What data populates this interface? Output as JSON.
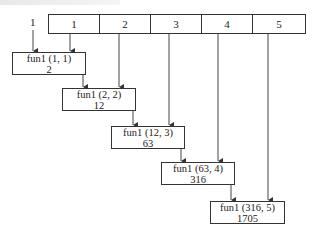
{
  "diagram": {
    "initial_value_label": "1",
    "header_cells": [
      "1",
      "2",
      "3",
      "4",
      "5"
    ],
    "calls": [
      {
        "call": "fun1 (1, 1)",
        "result": "2"
      },
      {
        "call": "fun1 (2, 2)",
        "result": "12"
      },
      {
        "call": "fun1 (12, 3)",
        "result": "63"
      },
      {
        "call": "fun1 (63, 4)",
        "result": "316"
      },
      {
        "call": "fun1 (316, 5)",
        "result": "1705"
      }
    ],
    "colors": {
      "line": "#333333",
      "background": "#ffffff"
    }
  }
}
